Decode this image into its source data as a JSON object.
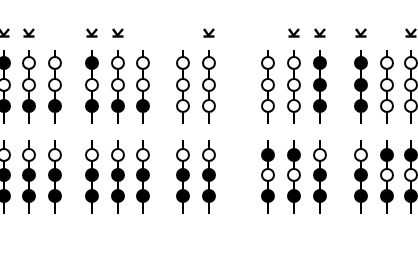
{
  "diagram": {
    "marker_symbol": "K (rotated)",
    "colors": {
      "filled": "#000000",
      "open": "#ffffff",
      "line": "#000000",
      "background": "#ffffff"
    },
    "columns": [
      {
        "x": 4,
        "k_mark": true,
        "top": [
          "filled",
          "open",
          "filled"
        ],
        "bottom": [
          "open",
          "filled",
          "filled"
        ]
      },
      {
        "x": 29,
        "k_mark": true,
        "top": [
          "open",
          "open",
          "filled"
        ],
        "bottom": [
          "open",
          "filled",
          "filled"
        ]
      },
      {
        "x": 55,
        "k_mark": false,
        "top": [
          "open",
          "open",
          "filled"
        ],
        "bottom": [
          "open",
          "filled",
          "filled"
        ]
      },
      {
        "x": 92,
        "k_mark": true,
        "top": [
          "filled",
          "open",
          "filled"
        ],
        "bottom": [
          "open",
          "filled",
          "filled"
        ]
      },
      {
        "x": 118,
        "k_mark": true,
        "top": [
          "open",
          "open",
          "filled"
        ],
        "bottom": [
          "open",
          "filled",
          "filled"
        ]
      },
      {
        "x": 143,
        "k_mark": false,
        "top": [
          "open",
          "open",
          "filled"
        ],
        "bottom": [
          "open",
          "filled",
          "filled"
        ]
      },
      {
        "x": 183,
        "k_mark": false,
        "top": [
          "open",
          "open",
          "open"
        ],
        "bottom": [
          "open",
          "filled",
          "filled"
        ]
      },
      {
        "x": 209,
        "k_mark": true,
        "top": [
          "open",
          "open",
          "open"
        ],
        "bottom": [
          "open",
          "filled",
          "filled"
        ]
      },
      {
        "x": 268,
        "k_mark": false,
        "top": [
          "open",
          "open",
          "open"
        ],
        "bottom": [
          "filled",
          "open",
          "filled"
        ]
      },
      {
        "x": 294,
        "k_mark": true,
        "top": [
          "open",
          "open",
          "open"
        ],
        "bottom": [
          "filled",
          "open",
          "filled"
        ]
      },
      {
        "x": 320,
        "k_mark": true,
        "top": [
          "filled",
          "filled",
          "filled"
        ],
        "bottom": [
          "open",
          "filled",
          "filled"
        ]
      },
      {
        "x": 361,
        "k_mark": true,
        "top": [
          "filled",
          "filled",
          "filled"
        ],
        "bottom": [
          "open",
          "filled",
          "filled"
        ]
      },
      {
        "x": 387,
        "k_mark": false,
        "top": [
          "open",
          "open",
          "open"
        ],
        "bottom": [
          "filled",
          "open",
          "filled"
        ]
      },
      {
        "x": 411,
        "k_mark": true,
        "top": [
          "open",
          "open",
          "open"
        ],
        "bottom": [
          "filled",
          "open",
          "filled"
        ]
      }
    ]
  }
}
